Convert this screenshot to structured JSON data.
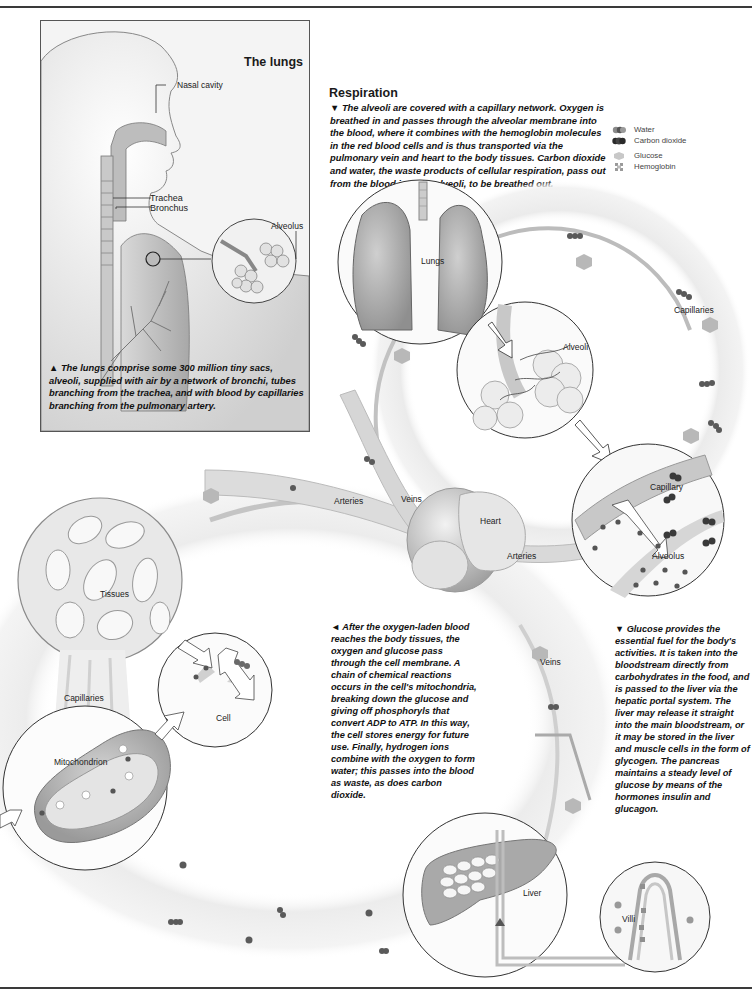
{
  "lungs_panel": {
    "title": "The lungs",
    "labels": {
      "nasal_cavity": "Nasal cavity",
      "trachea": "Trachea",
      "bronchus": "Bronchus",
      "alveolus": "Alveolus"
    },
    "caption_marker": "▲",
    "caption": "The lungs comprise some 300 million tiny sacs, alveoli, supplied with air by a network of bronchi, tubes branching from the trachea, and with blood by capillaries branching from the pulmonary artery."
  },
  "respiration": {
    "heading": "Respiration",
    "caption_marker": "▼",
    "caption": "The alveoli are covered with a capillary network. Oxygen is breathed in and passes through the alveolar membrane into the blood, where it combines with the hemoglobin molecules in the red blood cells and is thus transported via the pulmonary vein and heart to the body tissues. Carbon dioxide and water, the waste products of cellular respiration, pass out from the blood into the alveoli, to be breathed out."
  },
  "legend": {
    "items": [
      {
        "label": "Water",
        "icon": "water-molecule-icon",
        "color": "#8a8a8a"
      },
      {
        "label": "Carbon dioxide",
        "icon": "carbon-dioxide-molecule-icon",
        "color": "#2a2a2a"
      },
      {
        "label": "Glucose",
        "icon": "glucose-hexagon-icon",
        "color": "#c8c8c8"
      },
      {
        "label": "Hemoglobin",
        "icon": "hemoglobin-icon",
        "color": "#9a9a9a"
      }
    ]
  },
  "diagram_labels": {
    "lungs": "Lungs",
    "alveoli": "Alveoli",
    "capillaries_right": "Capillaries",
    "capillary": "Capillary",
    "alveolus": "Alveolus",
    "heart": "Heart",
    "arteries_left": "Arteries",
    "veins_top": "Veins",
    "arteries_right": "Arteries",
    "tissues": "Tissues",
    "capillaries_left": "Capillaries",
    "cell": "Cell",
    "mitochondrion": "Mitochondrion",
    "veins_lower": "Veins",
    "liver": "Liver",
    "villi": "Villi"
  },
  "cell_caption": {
    "marker": "◄",
    "text": "After the oxygen-laden blood reaches the body tissues, the oxygen and glucose pass through the cell membrane. A chain of chemical reactions occurs in the cell's mitochondria, breaking down the glucose and giving off phosphoryls that convert ADP to ATP. In this way, the cell stores energy for future use. Finally, hydrogen ions combine with the oxygen to form water; this passes into the blood as waste, as does carbon dioxide."
  },
  "glucose_caption": {
    "marker": "▼",
    "text": "Glucose provides the essential fuel for the body's activities. It is taken into the bloodstream directly from carbohydrates in the food, and is passed to the liver via the hepatic portal system. The liver may release it straight into the main bloodstream, or it may be stored in the liver and muscle cells in the form of glycogen. The pancreas maintains a steady level of glucose by means of the hormones insulin and glucagon."
  }
}
